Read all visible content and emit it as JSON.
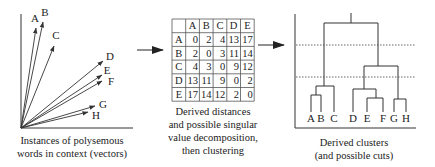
{
  "vectors_panel": {
    "caption_lines": [
      "Instances of polysemous",
      "words in context (vectors)"
    ],
    "vectors": [
      {
        "label": "A"
      },
      {
        "label": "B"
      },
      {
        "label": "C"
      },
      {
        "label": "D"
      },
      {
        "label": "E"
      },
      {
        "label": "F"
      },
      {
        "label": "G"
      },
      {
        "label": "H"
      }
    ]
  },
  "matrix_panel": {
    "caption_lines": [
      "Derived distances",
      "and possible singular",
      "value decomposition,",
      "then clustering"
    ],
    "headers": [
      "A",
      "B",
      "C",
      "D",
      "E"
    ],
    "rows": [
      {
        "label": "A",
        "values": [
          "0",
          "2",
          "4",
          "13",
          "17"
        ]
      },
      {
        "label": "B",
        "values": [
          "2",
          "0",
          "3",
          "11",
          "14"
        ]
      },
      {
        "label": "C",
        "values": [
          "4",
          "3",
          "0",
          "9",
          "12"
        ]
      },
      {
        "label": "D",
        "values": [
          "13",
          "11",
          "9",
          "0",
          "2"
        ]
      },
      {
        "label": "E",
        "values": [
          "17",
          "14",
          "12",
          "2",
          "0"
        ]
      }
    ]
  },
  "dendrogram_panel": {
    "caption_lines": [
      "Derived clusters",
      "(and possible cuts)"
    ],
    "leaves": [
      "A",
      "B",
      "C",
      "D",
      "E",
      "F",
      "G",
      "H"
    ],
    "cuts": 2
  }
}
